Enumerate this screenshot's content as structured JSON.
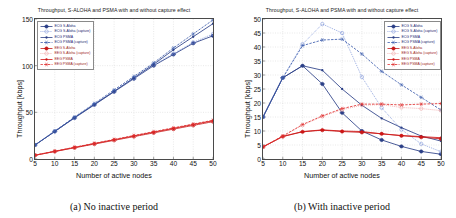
{
  "figure": {
    "panels": [
      {
        "id": "panel-a",
        "caption": "(a)  No inactive period",
        "title": "Throughput, S-ALOHA and PSMA with and without capture effect",
        "chart_data": {
          "type": "line",
          "title": "Throughput, S-ALOHA and PSMA with and without capture effect",
          "xlabel": "Number of active nodes",
          "ylabel": "Throughput [kbps]",
          "xlim": [
            5,
            50
          ],
          "ylim": [
            0,
            150
          ],
          "xticks": [
            5,
            10,
            15,
            20,
            25,
            30,
            35,
            40,
            45,
            50
          ],
          "yticks": [
            0,
            50,
            100,
            150
          ],
          "grid": true,
          "legend_position": "top-left",
          "x": [
            5,
            10,
            15,
            20,
            25,
            30,
            35,
            40,
            45,
            50
          ],
          "series": [
            {
              "name": "ECG S-Aloha",
              "color": "#2b3f87",
              "dash": "solid",
              "marker": "circle-cross",
              "values": [
                15,
                29.5,
                44,
                58,
                72,
                86,
                100,
                112,
                124,
                132
              ]
            },
            {
              "name": "ECG S-Aloha (capture)",
              "color": "#7b93d8",
              "dash": "dotted",
              "marker": "circle",
              "values": [
                15,
                29.5,
                44,
                58.5,
                72.5,
                86.5,
                101,
                113,
                125,
                134
              ]
            },
            {
              "name": "ECG PSMA",
              "color": "#2b3f87",
              "dash": "solid",
              "marker": "dot",
              "values": [
                15,
                29.5,
                44.5,
                58.5,
                72.5,
                87,
                101.5,
                117,
                131,
                145
              ]
            },
            {
              "name": "ECG PSMA (capture)",
              "color": "#3f5fae",
              "dash": "dashed",
              "marker": "star",
              "values": [
                15,
                30,
                45,
                59.5,
                74,
                88.5,
                103,
                119,
                134,
                149
              ]
            },
            {
              "name": "EEG S-Aloha",
              "color": "#c51b1b",
              "dash": "solid",
              "marker": "circle-cross",
              "values": [
                4,
                8,
                12,
                16,
                20,
                24,
                28,
                32,
                36,
                40
              ]
            },
            {
              "name": "EEG S-Aloha (capture)",
              "color": "#f0a0a0",
              "dash": "dotted",
              "marker": "circle",
              "values": [
                4,
                8.1,
                12.2,
                16.3,
                20.3,
                24.3,
                28.4,
                32.4,
                36.4,
                40.4
              ]
            },
            {
              "name": "EEG PSMA",
              "color": "#d01515",
              "dash": "solid",
              "marker": "dot",
              "values": [
                4,
                8.2,
                12.4,
                16.5,
                20.6,
                24.7,
                28.8,
                32.8,
                36.9,
                41
              ]
            },
            {
              "name": "EEG PSMA (capture)",
              "color": "#e03030",
              "dash": "dashed",
              "marker": "star",
              "values": [
                4.2,
                8.4,
                12.6,
                16.8,
                21,
                25.2,
                29.3,
                33.4,
                37.5,
                41.5
              ]
            }
          ]
        }
      },
      {
        "id": "panel-b",
        "caption": "(b)  With inactive period",
        "title": "Throughput, S-ALOHA and PSMA with and without capture effect",
        "chart_data": {
          "type": "line",
          "title": "Throughput, S-ALOHA and PSMA with and without capture effect",
          "xlabel": "Number of active nodes",
          "ylabel": "Throughput [kbps]",
          "xlim": [
            5,
            50
          ],
          "ylim": [
            0,
            50
          ],
          "xticks": [
            5,
            10,
            15,
            20,
            25,
            30,
            35,
            40,
            45,
            50
          ],
          "yticks": [
            0,
            5,
            10,
            15,
            20,
            25,
            30,
            35,
            40,
            45,
            50
          ],
          "grid": true,
          "legend_position": "top-right",
          "x": [
            5,
            10,
            15,
            20,
            25,
            30,
            35,
            40,
            45,
            50
          ],
          "series": [
            {
              "name": "ECG S-Aloha",
              "color": "#2b3f87",
              "dash": "solid",
              "marker": "circle-cross",
              "values": [
                15,
                29,
                33.3,
                26.8,
                16.5,
                10,
                6.8,
                4.5,
                2.7,
                1.7
              ]
            },
            {
              "name": "ECG S-Aloha (capture)",
              "color": "#7b93d8",
              "dash": "dotted",
              "marker": "circle",
              "values": [
                15,
                29,
                41,
                48.2,
                45,
                29.3,
                18.3,
                10.5,
                5.4,
                2.6
              ]
            },
            {
              "name": "ECG PSMA",
              "color": "#2b3f87",
              "dash": "solid",
              "marker": "dot",
              "values": [
                15,
                29,
                33.3,
                31.7,
                25,
                19.2,
                14.5,
                11.2,
                8.2,
                6.4
              ]
            },
            {
              "name": "ECG PSMA (capture)",
              "color": "#3f5fae",
              "dash": "dashed",
              "marker": "star",
              "values": [
                15,
                29,
                40.5,
                42.5,
                42.8,
                37.5,
                31.3,
                26.5,
                22,
                17.5
              ]
            },
            {
              "name": "EEG S-Aloha",
              "color": "#c51b1b",
              "dash": "solid",
              "marker": "circle-cross",
              "values": [
                4.3,
                8,
                9.7,
                10.3,
                9.8,
                9.5,
                9,
                8.3,
                7.8,
                7.2
              ]
            },
            {
              "name": "EEG S-Aloha (capture)",
              "color": "#f0a0a0",
              "dash": "dotted",
              "marker": "circle",
              "values": [
                4.3,
                8.1,
                12.1,
                15.2,
                17.6,
                19.2,
                19.4,
                18.4,
                18,
                17.3
              ]
            },
            {
              "name": "EEG PSMA",
              "color": "#d01515",
              "dash": "solid",
              "marker": "dot",
              "values": [
                4.3,
                8.1,
                9.8,
                10.4,
                10,
                9.8,
                9,
                8.4,
                8,
                7.6
              ]
            },
            {
              "name": "EEG PSMA (capture)",
              "color": "#e03030",
              "dash": "dashed",
              "marker": "star",
              "values": [
                4.4,
                8.2,
                12.3,
                15.4,
                18,
                19.6,
                19.6,
                19.3,
                19.6,
                19.8
              ]
            }
          ]
        }
      }
    ]
  }
}
